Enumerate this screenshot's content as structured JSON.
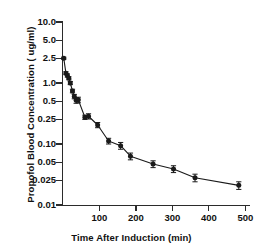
{
  "figure": {
    "background": "#ffffff",
    "ink": "#1a1a1a"
  },
  "axes": {
    "ylabel": "Propofol Blood Concentration ( ug/ml)",
    "xlabel": "Time After Induction (min)",
    "y_ticklabels": [
      "10.0",
      "5.0",
      "2.5",
      "1.0",
      "0.5",
      "0.25",
      "0.10",
      "0.05",
      "0.025",
      "0.01"
    ],
    "y_tickvalues": [
      10.0,
      5.0,
      2.5,
      1.0,
      0.5,
      0.25,
      0.1,
      0.05,
      0.025,
      0.01
    ],
    "x_ticklabels": [
      "100",
      "200",
      "300",
      "400",
      "500"
    ],
    "x_tickvalues": [
      100,
      200,
      300,
      400,
      500
    ]
  },
  "chart_data": {
    "type": "line",
    "title": "",
    "subtitle": "",
    "xlabel": "Time After Induction (min)",
    "ylabel": "Propofol Blood Concentration ( ug/ml)",
    "yscale": "log",
    "xscale": "linear",
    "ylim": [
      0.01,
      10.0
    ],
    "xlim": [
      0,
      510
    ],
    "grid": false,
    "legend": null,
    "marker": "filled-circle",
    "errorbars": "standard-error",
    "series": [
      {
        "name": "Propofol blood concentration",
        "x": [
          2,
          8,
          12,
          16,
          20,
          26,
          31,
          36,
          42,
          60,
          70,
          95,
          125,
          158,
          185,
          247,
          303,
          362,
          482
        ],
        "y": [
          2.55,
          1.45,
          1.33,
          1.2,
          1.0,
          0.74,
          0.6,
          0.52,
          0.53,
          0.275,
          0.285,
          0.205,
          0.112,
          0.094,
          0.063,
          0.047,
          0.039,
          0.028,
          0.021
        ],
        "yerr": [
          0.1,
          0.08,
          0.08,
          0.07,
          0.06,
          0.05,
          0.05,
          0.055,
          0.055,
          0.022,
          0.028,
          0.02,
          0.012,
          0.012,
          0.008,
          0.006,
          0.005,
          0.004,
          0.003
        ]
      }
    ]
  }
}
